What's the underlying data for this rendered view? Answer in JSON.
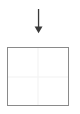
{
  "canvas": {
    "width": 80,
    "height": 114,
    "background_color": "#ffffff"
  },
  "arrow": {
    "icon_name": "arrow-down-icon",
    "direction": "down",
    "color": "#3a3a3a",
    "stem_top_y": 10,
    "stem_bottom_y": 27,
    "head_tip_y": 32,
    "center_x": 39,
    "label": ""
  },
  "box": {
    "name": "empty-square-frame",
    "fill_color": "#ffffff",
    "border_color": "#8a8a8a",
    "border_width_px": 1.5,
    "left": 7,
    "top": 47,
    "width": 62,
    "height": 59,
    "label": "",
    "guides": {
      "visible": true,
      "color": "#f1f1f1",
      "vertical_center": true,
      "horizontal_center": true
    }
  },
  "diagram_data": {
    "type": "diagram",
    "title": "",
    "nodes": [
      {
        "id": "arrow",
        "shape": "arrow-down",
        "text": ""
      },
      {
        "id": "frame",
        "shape": "square",
        "text": ""
      }
    ],
    "edges": [],
    "annotations": []
  }
}
